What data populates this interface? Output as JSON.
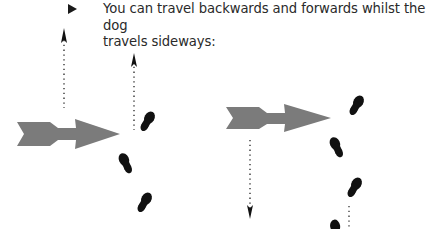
{
  "bullet_text": {
    "line1": "You can travel backwards and forwards whilst the dog",
    "line2": "travels sideways:"
  },
  "colors": {
    "arrow": "#7b7b7b",
    "footprint": "#111111",
    "dotted_line": "#222222",
    "text": "#2a2a2a"
  },
  "figures": [
    {
      "name": "forward-scenario",
      "direction_arrow": "right",
      "movement": "up"
    },
    {
      "name": "backward-scenario",
      "direction_arrow": "right",
      "movement": "down"
    }
  ]
}
